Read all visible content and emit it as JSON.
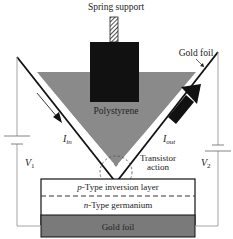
{
  "diagram": {
    "labels": {
      "spring_support": "Spring support",
      "gold_foil_top": "Gold foil",
      "polystyrene": "Polystyrene",
      "i_in_main": "I",
      "i_in_sub": "in",
      "i_out_main": "I",
      "i_out_sub": "out",
      "transistor_action_line1": "Transistor",
      "transistor_action_line2": "action",
      "v1_main": "V",
      "v1_sub": "1",
      "v2_main": "V",
      "v2_sub": "2",
      "p_type_prefix": "p",
      "p_type_rest": "-Type inversion layer",
      "n_type_prefix": "n",
      "n_type_rest": "-Type germanium",
      "gold_foil_bottom": "Gold foil"
    },
    "colors": {
      "polystyrene": "#8a8a8a",
      "black_block": "#111111",
      "gold_foil_base": "#7a7a7a",
      "wire": "#9a9a9a",
      "foil_line": "#111111"
    }
  }
}
